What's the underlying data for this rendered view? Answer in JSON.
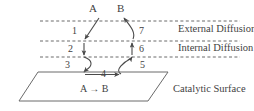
{
  "diagram": {
    "title_species": {
      "reactant": "A",
      "product": "B"
    },
    "reaction_label": "A → B",
    "zones": [
      {
        "id": "external-diffusion",
        "label": "External Diffusion"
      },
      {
        "id": "internal-diffusion",
        "label": "Internal Diffusion"
      },
      {
        "id": "catalytic-surface",
        "label": "Catalytic Surface"
      }
    ],
    "steps": [
      {
        "id": 1,
        "label": "1"
      },
      {
        "id": 2,
        "label": "2"
      },
      {
        "id": 3,
        "label": "3"
      },
      {
        "id": 4,
        "label": "4"
      },
      {
        "id": 5,
        "label": "5"
      },
      {
        "id": 6,
        "label": "6"
      },
      {
        "id": 7,
        "label": "7"
      }
    ],
    "colors": {
      "ink": "#3f3f3f",
      "line": "#555555",
      "dashed": "#6b6b6b",
      "background": "#ffffff"
    }
  }
}
